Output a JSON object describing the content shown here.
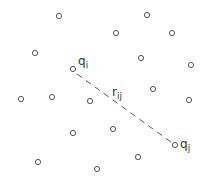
{
  "diagram": {
    "colors": {
      "stroke": "#555555",
      "text": "#333333",
      "background": "#ffffff"
    },
    "particles": [
      {
        "x": 59,
        "y": 16
      },
      {
        "x": 147,
        "y": 15
      },
      {
        "x": 116,
        "y": 33
      },
      {
        "x": 172,
        "y": 33
      },
      {
        "x": 35,
        "y": 53
      },
      {
        "x": 141,
        "y": 58
      },
      {
        "x": 191,
        "y": 65
      },
      {
        "x": 73,
        "y": 69,
        "label": "q_i"
      },
      {
        "x": 153,
        "y": 89
      },
      {
        "x": 21,
        "y": 99
      },
      {
        "x": 52,
        "y": 97
      },
      {
        "x": 90,
        "y": 101
      },
      {
        "x": 189,
        "y": 100
      },
      {
        "x": 113,
        "y": 129
      },
      {
        "x": 73,
        "y": 133
      },
      {
        "x": 175,
        "y": 145,
        "label": "q_j"
      },
      {
        "x": 138,
        "y": 157
      },
      {
        "x": 38,
        "y": 162
      },
      {
        "x": 97,
        "y": 169
      }
    ],
    "labels": {
      "qi": {
        "base": "q",
        "sub": "i"
      },
      "qj": {
        "base": "q",
        "sub": "j"
      },
      "rij": {
        "base": "r",
        "sub": "ij"
      }
    },
    "distance_line": {
      "from": "q_i",
      "to": "q_j",
      "style": "dashed"
    }
  }
}
